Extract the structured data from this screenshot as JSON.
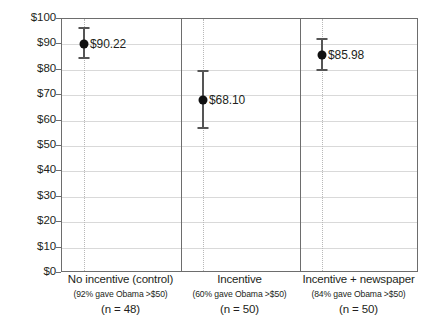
{
  "chart_data": {
    "type": "scatter",
    "title": "",
    "xlabel": "",
    "ylabel": "",
    "ylim": [
      0,
      100
    ],
    "grid": true,
    "legend": "none",
    "value_prefix": "$",
    "categories": [
      "No incentive (control)",
      "Incentive",
      "Incentive + newspaper"
    ],
    "category_sublabels": [
      "(92% gave Obama >$50)",
      "(60% gave Obama >$50)",
      "(84% gave Obama >$50)"
    ],
    "category_counts": [
      "(n = 48)",
      "(n = 50)",
      "(n = 50)"
    ],
    "values": [
      90.22,
      68.1,
      85.98
    ],
    "value_labels": [
      "$90.22",
      "$68.10",
      "$85.98"
    ],
    "error_low": [
      84.5,
      57.0,
      80.0
    ],
    "error_high": [
      96.5,
      79.5,
      92.0
    ],
    "yticks": [
      0,
      10,
      20,
      30,
      40,
      50,
      60,
      70,
      80,
      90,
      100
    ],
    "ytick_labels": [
      "$0",
      "$10",
      "$20",
      "$30",
      "$40",
      "$50",
      "$60",
      "$70",
      "$80",
      "$90",
      "$100"
    ],
    "colors": {
      "marker": "#111111",
      "errorbar": "#555555",
      "gridline": "#d9d9d9",
      "axis": "#6d6d6d",
      "guide": "#b8b8b8",
      "text": "#231f20",
      "background": "#ffffff"
    }
  }
}
